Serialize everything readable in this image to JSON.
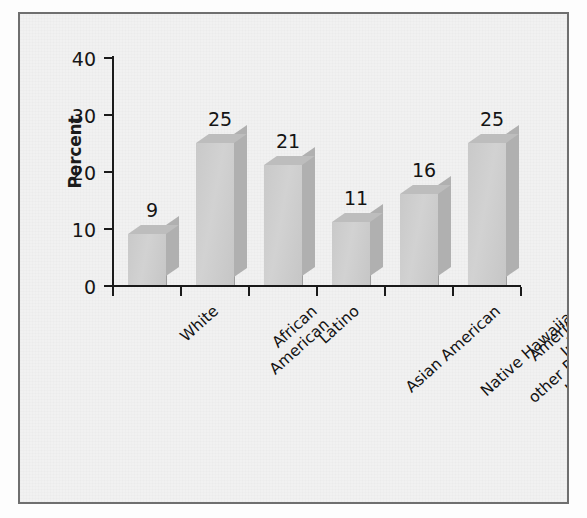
{
  "chart_data": {
    "type": "bar",
    "title": "",
    "subtitle": "",
    "xlabel": "",
    "ylabel": "Percent",
    "ylim": [
      0,
      40
    ],
    "yticks": [
      0,
      10,
      20,
      30,
      40
    ],
    "grid": false,
    "legend": null,
    "value_labels": true,
    "style": "3d-bar-grayscale",
    "categories": [
      "White",
      "African\nAmerican",
      "Latino",
      "Asian American",
      "Native Hawaiian and\nother Pacific Islander",
      "American Indian\nand Alaska Native"
    ],
    "categories_flat": [
      "White",
      "African American",
      "Latino",
      "Asian American",
      "Native Hawaiian and other Pacific Islander",
      "American Indian and Alaska Native"
    ],
    "values": [
      9,
      25,
      21,
      11,
      16,
      25
    ],
    "value_label_texts": [
      "9",
      "25",
      "21",
      "11",
      "16",
      "25"
    ],
    "ytick_labels": [
      "0",
      "10",
      "20",
      "30",
      "40"
    ]
  },
  "colors": {
    "page_background": "#fdfdfd",
    "plot_background": "#f1f1f1",
    "frame_border": "#6f6f6f",
    "axis": "#1a1a1a",
    "bar_front": "#d2d2d2",
    "bar_side": "#b0b0b0",
    "bar_top": "#bdbdbd",
    "text": "#131313"
  }
}
